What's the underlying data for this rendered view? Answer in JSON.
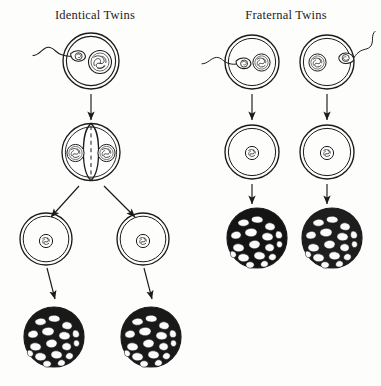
{
  "figure": {
    "kind": "biology-diagram",
    "background_color": "#fdfdfc",
    "ink_color": "#1b1b1b"
  },
  "panels": [
    {
      "id": "identical",
      "title": "Identical Twins",
      "stage_count": 4,
      "stages": [
        {
          "name": "fertilized-egg",
          "count": 1,
          "sperm": 1,
          "nuclei": 1
        },
        {
          "name": "dividing-zygote",
          "count": 1,
          "sperm": 0,
          "nuclei": 2
        },
        {
          "name": "separated-cells",
          "count": 2,
          "sperm": 0,
          "nuclei": 1
        },
        {
          "name": "embryo-morula",
          "count": 2,
          "sperm": 0,
          "nuclei": 0
        }
      ]
    },
    {
      "id": "fraternal",
      "title": "Fraternal Twins",
      "stage_count": 3,
      "stages": [
        {
          "name": "fertilized-egg",
          "count": 2,
          "sperm": 1,
          "nuclei": 1
        },
        {
          "name": "zygote",
          "count": 2,
          "sperm": 0,
          "nuclei": 1
        },
        {
          "name": "embryo-morula",
          "count": 2,
          "sperm": 0,
          "nuclei": 0
        }
      ]
    }
  ],
  "cells": {
    "identical_egg": {
      "cx": 91,
      "cy": 61,
      "r": 28
    },
    "identical_divide": {
      "cx": 91,
      "cy": 152,
      "r": 29
    },
    "identical_left_cell": {
      "cx": 46,
      "cy": 239,
      "r": 26
    },
    "identical_right_cell": {
      "cx": 143,
      "cy": 239,
      "r": 26
    },
    "identical_left_morula": {
      "cx": 54,
      "cy": 337,
      "r": 30
    },
    "identical_right_morula": {
      "cx": 151,
      "cy": 337,
      "r": 30
    },
    "fraternal_left_egg": {
      "cx": 252,
      "cy": 62,
      "r": 27
    },
    "fraternal_right_egg": {
      "cx": 327,
      "cy": 62,
      "r": 27
    },
    "fraternal_left_zygote": {
      "cx": 252,
      "cy": 152,
      "r": 27
    },
    "fraternal_right_zygote": {
      "cx": 327,
      "cy": 152,
      "r": 27
    },
    "fraternal_left_morula": {
      "cx": 257,
      "cy": 238,
      "r": 30
    },
    "fraternal_right_morula": {
      "cx": 332,
      "cy": 238,
      "r": 30
    }
  }
}
